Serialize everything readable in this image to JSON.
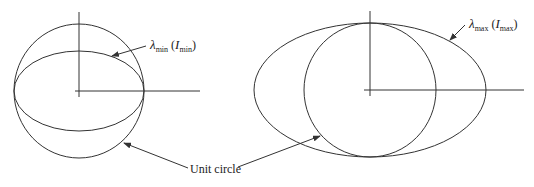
{
  "figure": {
    "left": {
      "label_symbol": "λ",
      "label_sub": "min",
      "label_paren_open": " (",
      "label_paren_symbol": "I",
      "label_paren_sub": "min",
      "label_paren_close": ")"
    },
    "right": {
      "label_symbol": "λ",
      "label_sub": "max",
      "label_paren_open": " (",
      "label_paren_symbol": "I",
      "label_paren_sub": "max",
      "label_paren_close": ")"
    },
    "shared_label": "Unit circle"
  },
  "colors": {
    "stroke": "#333333",
    "background": "#ffffff"
  }
}
